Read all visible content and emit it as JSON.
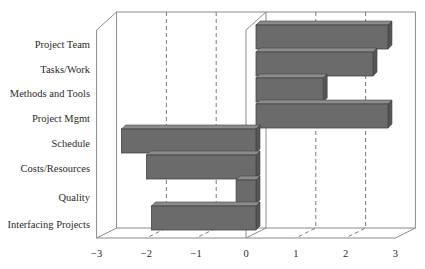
{
  "chart_data": {
    "type": "bar",
    "orientation": "horizontal",
    "style": "3d",
    "title": "",
    "xlabel": "",
    "ylabel": "",
    "xlim": [
      -3,
      3
    ],
    "xticks": [
      "-3",
      "-2",
      "-1",
      "0",
      "1",
      "2",
      "3"
    ],
    "grid": "dashed vertical at integer ticks",
    "categories": [
      "Project Team",
      "Tasks/Work",
      "Methods and Tools",
      "Project Mgmt",
      "Schedule",
      "Costs/Resources",
      "Quality",
      "Interfacing Projects"
    ],
    "values": [
      2.65,
      2.35,
      1.35,
      2.65,
      -2.7,
      -2.2,
      -0.4,
      -2.1
    ],
    "bar_color": "#6b6b6b",
    "bar_top_color": "#8c8c8c",
    "bar_side_color": "#555555"
  }
}
